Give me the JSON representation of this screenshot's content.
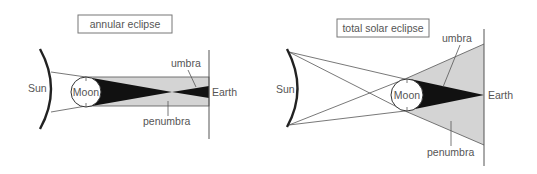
{
  "colors": {
    "background": "#ffffff",
    "line": "#333333",
    "text": "#555555",
    "penumbra_fill": "#d4d4d4",
    "umbra_fill": "#111111",
    "box_border": "#777777"
  },
  "annular": {
    "title": "annular eclipse",
    "labels": {
      "sun": "Sun",
      "moon": "Moon",
      "earth": "Earth",
      "umbra": "umbra",
      "penumbra": "penumbra"
    }
  },
  "total": {
    "title": "total solar eclipse",
    "labels": {
      "sun": "Sun",
      "moon": "Moon",
      "earth": "Earth",
      "umbra": "umbra",
      "penumbra": "penumbra"
    }
  }
}
